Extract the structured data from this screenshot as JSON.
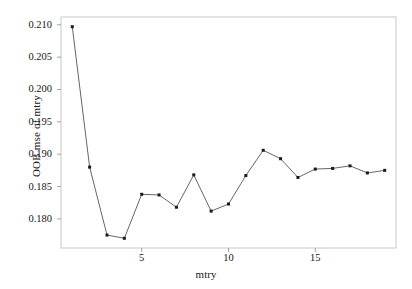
{
  "chart_data": {
    "type": "line",
    "title": "",
    "xlabel": "mtry",
    "ylabel": "OOB mse of mtry",
    "x": [
      1,
      2,
      3,
      4,
      5,
      6,
      7,
      8,
      9,
      10,
      11,
      12,
      13,
      14,
      15,
      16,
      17,
      18,
      19
    ],
    "values": [
      0.2097,
      0.188,
      0.1775,
      0.177,
      0.1838,
      0.1837,
      0.1818,
      0.1868,
      0.1812,
      0.1823,
      0.1867,
      0.1906,
      0.1893,
      0.1864,
      0.1877,
      0.1878,
      0.1882,
      0.1871,
      0.1875
    ],
    "xlim": [
      0.35,
      19.65
    ],
    "ylim": [
      0.1755,
      0.2112
    ],
    "xticks": [
      5,
      10,
      15
    ],
    "xtick_labels": [
      "5",
      "10",
      "15"
    ],
    "yticks": [
      0.18,
      0.185,
      0.19,
      0.195,
      0.2,
      0.205,
      0.21
    ],
    "ytick_labels": [
      "0.180",
      "0.185",
      "0.190",
      "0.195",
      "0.200",
      "0.205",
      "0.210"
    ],
    "grid": false,
    "legend": null,
    "marker": "square",
    "line_color": "#555555",
    "marker_color": "#1a1a1a",
    "frame_color": "#c8c8c8",
    "background": "#ffffff"
  }
}
